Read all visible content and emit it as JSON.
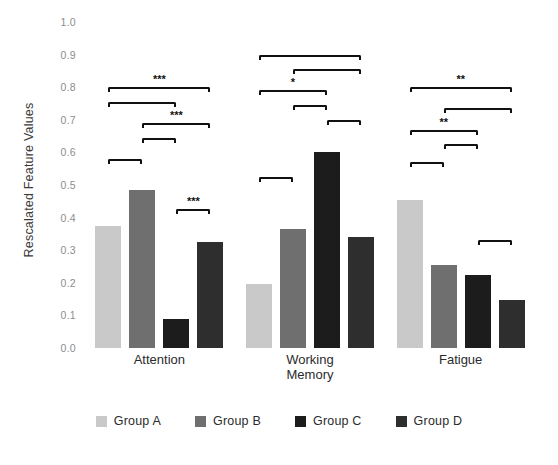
{
  "chart_data": {
    "type": "bar",
    "title": "",
    "xlabel": "",
    "ylabel": "Rescalated Feature Values",
    "ylim": [
      0.0,
      1.0
    ],
    "grid": false,
    "legend_position": "bottom",
    "categories": [
      "Attention",
      "Working\nMemory",
      "Fatigue"
    ],
    "ytick_labels": [
      "1.0",
      "0.9",
      "0.8",
      "0.7",
      "0.6",
      "0.5",
      "0.4",
      "0.3",
      "0.2",
      "0.1",
      "0.0"
    ],
    "ytick_values": [
      1.0,
      0.9,
      0.8,
      0.7,
      0.6,
      0.5,
      0.4,
      0.3,
      0.2,
      0.1,
      0.0
    ],
    "series": [
      {
        "name": "Group A",
        "color": "#c9c9c9",
        "values": [
          0.375,
          0.195,
          0.455
        ]
      },
      {
        "name": "Group B",
        "color": "#6f6f6f",
        "values": [
          0.485,
          0.365,
          0.255
        ]
      },
      {
        "name": "Group C",
        "color": "#1c1c1c",
        "values": [
          0.09,
          0.6,
          0.225
        ]
      },
      {
        "name": "Group D",
        "color": "#2e2e2e",
        "values": [
          0.325,
          0.34,
          0.148
        ]
      }
    ],
    "annotations": [
      {
        "category": "Attention",
        "from": 0,
        "to": 3,
        "y": 0.8,
        "stars": "***"
      },
      {
        "category": "Attention",
        "from": 0,
        "to": 2,
        "y": 0.755,
        "stars": ""
      },
      {
        "category": "Attention",
        "from": 1,
        "to": 3,
        "y": 0.69,
        "stars": "***"
      },
      {
        "category": "Attention",
        "from": 1,
        "to": 2,
        "y": 0.645,
        "stars": ""
      },
      {
        "category": "Attention",
        "from": 0,
        "to": 1,
        "y": 0.58,
        "stars": ""
      },
      {
        "category": "Attention",
        "from": 2,
        "to": 3,
        "y": 0.425,
        "stars": "***"
      },
      {
        "category": "Working Memory",
        "from": 0,
        "to": 3,
        "y": 0.9,
        "stars": ""
      },
      {
        "category": "Working Memory",
        "from": 1,
        "to": 3,
        "y": 0.855,
        "stars": ""
      },
      {
        "category": "Working Memory",
        "from": 0,
        "to": 2,
        "y": 0.79,
        "stars": "*"
      },
      {
        "category": "Working Memory",
        "from": 1,
        "to": 2,
        "y": 0.745,
        "stars": ""
      },
      {
        "category": "Working Memory",
        "from": 2,
        "to": 3,
        "y": 0.7,
        "stars": ""
      },
      {
        "category": "Working Memory",
        "from": 0,
        "to": 1,
        "y": 0.525,
        "stars": ""
      },
      {
        "category": "Fatigue",
        "from": 0,
        "to": 3,
        "y": 0.8,
        "stars": "**"
      },
      {
        "category": "Fatigue",
        "from": 1,
        "to": 3,
        "y": 0.735,
        "stars": ""
      },
      {
        "category": "Fatigue",
        "from": 0,
        "to": 2,
        "y": 0.67,
        "stars": "**"
      },
      {
        "category": "Fatigue",
        "from": 1,
        "to": 2,
        "y": 0.625,
        "stars": ""
      },
      {
        "category": "Fatigue",
        "from": 0,
        "to": 1,
        "y": 0.57,
        "stars": ""
      },
      {
        "category": "Fatigue",
        "from": 2,
        "to": 3,
        "y": 0.33,
        "stars": ""
      }
    ]
  },
  "legend": {
    "items": [
      {
        "label": "Group A",
        "color": "#c9c9c9"
      },
      {
        "label": "Group B",
        "color": "#6f6f6f"
      },
      {
        "label": "Group C",
        "color": "#1c1c1c"
      },
      {
        "label": "Group D",
        "color": "#2e2e2e"
      }
    ]
  }
}
